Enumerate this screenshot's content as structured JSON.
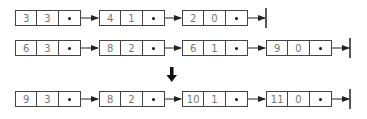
{
  "rows": [
    {
      "nodes": [
        {
          "coef": "3",
          "exp": "3"
        },
        {
          "coef": "4",
          "exp": "1"
        },
        {
          "coef": "2",
          "exp": "0"
        }
      ]
    },
    {
      "nodes": [
        {
          "coef": "6",
          "exp": "3"
        },
        {
          "coef": "8",
          "exp": "2"
        },
        {
          "coef": "6",
          "exp": "1"
        },
        {
          "coef": "9",
          "exp": "0"
        }
      ]
    },
    {
      "nodes": [
        {
          "coef": "9",
          "exp": "3"
        },
        {
          "coef": "8",
          "exp": "2"
        },
        {
          "coef": "10",
          "exp": "1"
        },
        {
          "coef": "11",
          "exp": "0"
        }
      ]
    }
  ],
  "colors": {
    "line": "#222222",
    "text": "#777777"
  }
}
